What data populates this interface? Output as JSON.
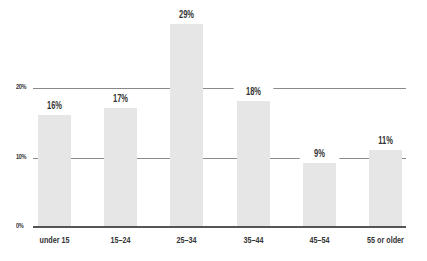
{
  "chart_data": {
    "type": "bar",
    "title": "",
    "xlabel": "",
    "ylabel": "",
    "categories": [
      "under 15",
      "15–24",
      "25–34",
      "35–44",
      "45–54",
      "55 or older"
    ],
    "values": [
      16,
      17,
      29,
      18,
      9,
      11
    ],
    "value_labels": [
      "16%",
      "17%",
      "29%",
      "18%",
      "9%",
      "11%"
    ],
    "y_ticks": [
      "0%",
      "10%",
      "20%"
    ],
    "ylim": [
      0,
      30
    ],
    "grid": true,
    "legend": null,
    "bar_color": "#e6e6e6"
  }
}
